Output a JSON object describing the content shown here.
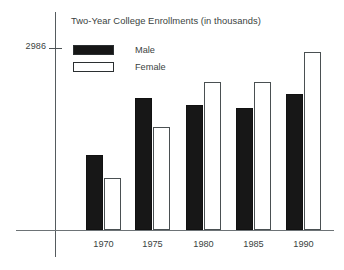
{
  "chart_data": {
    "type": "bar",
    "title": "Two-Year College Enrollments (in thousands)",
    "xlabel": "",
    "ylabel": "",
    "categories": [
      "1970",
      "1975",
      "1980",
      "1985",
      "1990"
    ],
    "series": [
      {
        "name": "Male",
        "color": "#171717",
        "values": [
          1230,
          2166,
          2051,
          2002,
          2232
        ]
      },
      {
        "name": "Female",
        "color": "#ffffff",
        "values": [
          853,
          1690,
          2429,
          2429,
          2921
        ]
      }
    ],
    "ylim": [
      0,
      3150
    ],
    "y_ticks": [
      "2986"
    ],
    "y_tick_values": [
      2986
    ],
    "grid": false,
    "legend_position": "top-left",
    "annotations": []
  },
  "axis": {
    "y_tick_label": "2986"
  },
  "legend": {
    "items": [
      {
        "label": "Male",
        "swatch": "filled"
      },
      {
        "label": "Female",
        "swatch": "hollow"
      }
    ]
  }
}
